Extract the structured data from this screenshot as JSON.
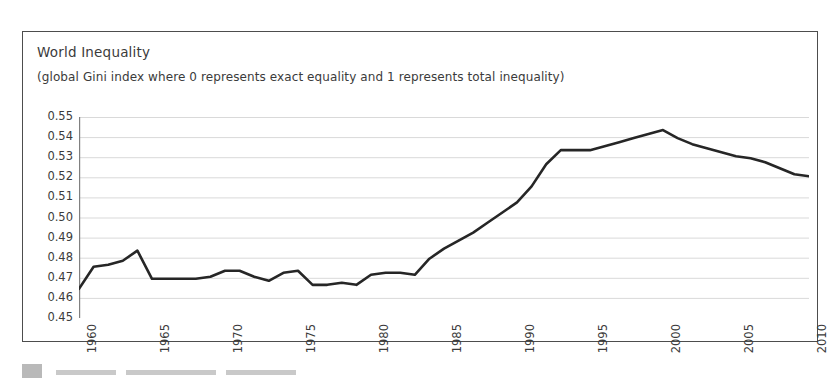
{
  "chart": {
    "title": "World Inequality",
    "subtitle": "(global Gini index where 0 represents exact equality and 1 represents total inequality)",
    "line_color": "#262626",
    "grid_color": "#d9d9d9",
    "axis_color": "#808080",
    "frame_color": "#4d4d4d"
  },
  "chart_data": {
    "type": "line",
    "title": "World Inequality",
    "subtitle": "(global Gini index where 0 represents exact equality and 1 represents total inequality)",
    "xlabel": "",
    "ylabel": "",
    "grid": true,
    "legend": false,
    "xlim": [
      1960,
      2010
    ],
    "ylim": [
      0.45,
      0.55
    ],
    "ytick_labels": [
      "0.55",
      "0.54",
      "0.53",
      "0.52",
      "0.51",
      "0.50",
      "0.49",
      "0.48",
      "0.47",
      "0.46",
      "0.45"
    ],
    "ytick_values": [
      0.55,
      0.54,
      0.53,
      0.52,
      0.51,
      0.5,
      0.49,
      0.48,
      0.47,
      0.46,
      0.45
    ],
    "xtick_labels": [
      "1960",
      "1965",
      "1970",
      "1975",
      "1980",
      "1985",
      "1990",
      "1995",
      "2000",
      "2005",
      "2010"
    ],
    "xtick_values": [
      1960,
      1965,
      1970,
      1975,
      1980,
      1985,
      1990,
      1995,
      2000,
      2005,
      2010
    ],
    "x": [
      1960,
      1961,
      1962,
      1963,
      1964,
      1965,
      1966,
      1967,
      1968,
      1969,
      1970,
      1971,
      1972,
      1973,
      1974,
      1975,
      1976,
      1977,
      1978,
      1979,
      1980,
      1981,
      1982,
      1983,
      1984,
      1985,
      1986,
      1987,
      1988,
      1989,
      1990,
      1991,
      1992,
      1993,
      1994,
      1995,
      1996,
      1997,
      1998,
      1999,
      2000,
      2001,
      2002,
      2003,
      2004,
      2005,
      2006,
      2007,
      2008,
      2009,
      2010
    ],
    "values": [
      0.4645,
      0.4755,
      0.4765,
      0.4785,
      0.4835,
      0.4695,
      0.4695,
      0.4695,
      0.4695,
      0.4705,
      0.4735,
      0.4735,
      0.4705,
      0.4685,
      0.4725,
      0.4735,
      0.4665,
      0.4665,
      0.4675,
      0.4665,
      0.4715,
      0.4725,
      0.4725,
      0.4715,
      0.4795,
      0.4845,
      0.4885,
      0.4925,
      0.4975,
      0.5025,
      0.5075,
      0.5155,
      0.5265,
      0.5335,
      0.5335,
      0.5335,
      0.5355,
      0.5375,
      0.5395,
      0.5415,
      0.5435,
      0.5395,
      0.5365,
      0.5345,
      0.5325,
      0.5305,
      0.5295,
      0.5275,
      0.5245,
      0.5215,
      0.5205
    ],
    "series": [
      {
        "name": "Global Gini index",
        "color": "#262626",
        "values": [
          0.4645,
          0.4755,
          0.4765,
          0.4785,
          0.4835,
          0.4695,
          0.4695,
          0.4695,
          0.4695,
          0.4705,
          0.4735,
          0.4735,
          0.4705,
          0.4685,
          0.4725,
          0.4735,
          0.4665,
          0.4665,
          0.4675,
          0.4665,
          0.4715,
          0.4725,
          0.4725,
          0.4715,
          0.4795,
          0.4845,
          0.4885,
          0.4925,
          0.4975,
          0.5025,
          0.5075,
          0.5155,
          0.5265,
          0.5335,
          0.5335,
          0.5335,
          0.5355,
          0.5375,
          0.5395,
          0.5415,
          0.5435,
          0.5395,
          0.5365,
          0.5345,
          0.5325,
          0.5305,
          0.5295,
          0.5275,
          0.5245,
          0.5215,
          0.5205
        ]
      }
    ]
  }
}
